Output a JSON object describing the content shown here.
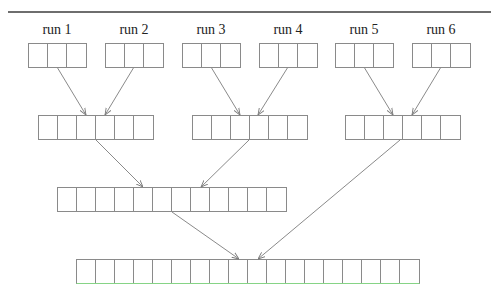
{
  "diagram": {
    "type": "merge-tree",
    "title": "",
    "runs": [
      {
        "label": "run 1",
        "cells": 3
      },
      {
        "label": "run 2",
        "cells": 3
      },
      {
        "label": "run 3",
        "cells": 3
      },
      {
        "label": "run 4",
        "cells": 3
      },
      {
        "label": "run 5",
        "cells": 3
      },
      {
        "label": "run 6",
        "cells": 3
      }
    ],
    "levels": [
      {
        "name": "level-1-runs",
        "blocks": [
          3,
          3,
          3,
          3,
          3,
          3
        ]
      },
      {
        "name": "level-2-merged",
        "blocks": [
          6,
          6,
          6
        ]
      },
      {
        "name": "level-3-merged",
        "blocks": [
          12
        ]
      },
      {
        "name": "level-4-final",
        "blocks": [
          18
        ]
      }
    ],
    "edges": [
      {
        "from": "run 1",
        "to": "level-2 block 1"
      },
      {
        "from": "run 2",
        "to": "level-2 block 1"
      },
      {
        "from": "run 3",
        "to": "level-2 block 2"
      },
      {
        "from": "run 4",
        "to": "level-2 block 2"
      },
      {
        "from": "run 5",
        "to": "level-2 block 3"
      },
      {
        "from": "run 6",
        "to": "level-2 block 3"
      },
      {
        "from": "level-2 block 1",
        "to": "level-3 block"
      },
      {
        "from": "level-2 block 2",
        "to": "level-3 block"
      },
      {
        "from": "level-3 block",
        "to": "level-4 block"
      },
      {
        "from": "level-2 block 3",
        "to": "level-4 block"
      }
    ],
    "colors": {
      "line": "#8a8a8a",
      "rule": "#6e6e6e",
      "final_bottom": "#86d486"
    }
  }
}
